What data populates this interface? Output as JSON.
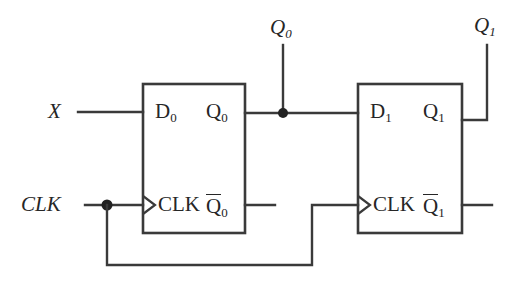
{
  "diagram": {
    "type": "digital-logic-schematic",
    "background_color": "#ffffff",
    "line_color": "#3a3a3a",
    "text_color": "#262626"
  },
  "inputs": [
    {
      "name": "x-input",
      "label": "X",
      "base": "X",
      "sub": ""
    },
    {
      "name": "clk-input",
      "label": "CLK",
      "base": "CLK",
      "sub": ""
    }
  ],
  "outputs": [
    {
      "name": "q0-output",
      "label": "Q0",
      "base": "Q",
      "sub": "0"
    },
    {
      "name": "q1-output",
      "label": "Q1",
      "base": "Q",
      "sub": "1"
    }
  ],
  "flipflops": [
    {
      "name": "flipflop-0",
      "pins": {
        "d": {
          "base": "D",
          "sub": "0"
        },
        "q": {
          "base": "Q",
          "sub": "0"
        },
        "clk": {
          "base": "CLK",
          "sub": ""
        },
        "qbar": {
          "base": "Q",
          "sub": "0",
          "overbar": true
        }
      }
    },
    {
      "name": "flipflop-1",
      "pins": {
        "d": {
          "base": "D",
          "sub": "1"
        },
        "q": {
          "base": "Q",
          "sub": "1"
        },
        "clk": {
          "base": "CLK",
          "sub": ""
        },
        "qbar": {
          "base": "Q",
          "sub": "1",
          "overbar": true
        }
      }
    }
  ],
  "junctions": [
    {
      "name": "clk-junction",
      "x": 107,
      "y": 205
    },
    {
      "name": "q0-junction",
      "x": 283,
      "y": 113
    }
  ]
}
